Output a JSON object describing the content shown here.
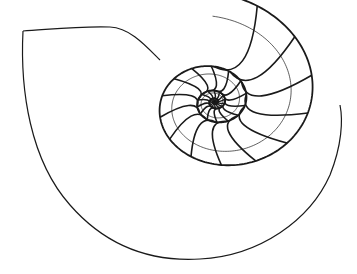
{
  "figure": {
    "subject": "Nautilus shell cross-section line drawing",
    "background_color": "#ffffff",
    "line_color": "#1a1a1a",
    "width": 357,
    "height": 274
  },
  "shell_outline": {
    "path": "M 23 31 C 45 30, 75 26, 110 27 C 130 28, 145 45, 160 60 M 23 31 C 20 90, 30 160, 70 205 C 105 245, 150 262, 200 259 C 260 256, 310 220, 330 175 C 342 145, 343 120, 340 105"
  },
  "spiral": {
    "center": [
      215,
      102
    ],
    "growth_per_turn": 3.1,
    "start_radius": 0.6,
    "end_radius": 128,
    "start_angle_deg": 0,
    "rotation_deg": 185,
    "squash_y": 0.86,
    "septa_per_turn": 14
  }
}
